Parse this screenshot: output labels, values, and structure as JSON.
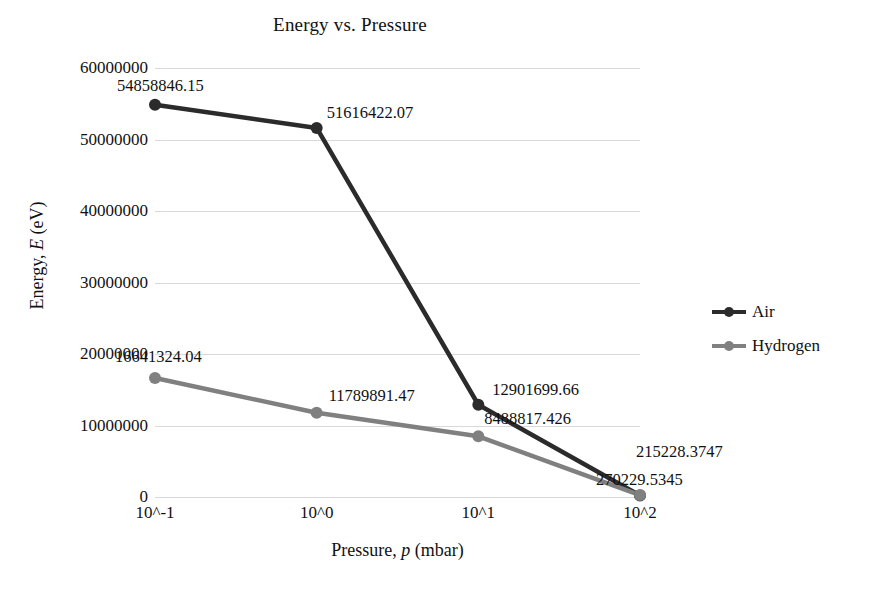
{
  "chart_data": {
    "type": "line",
    "title": "Energy vs. Pressure",
    "xlabel": "Pressure, p (mbar)",
    "ylabel": "Energy, E (eV)",
    "categories": [
      "10^-1",
      "10^0",
      "10^1",
      "10^2"
    ],
    "ylim": [
      0,
      60000000
    ],
    "ytick_labels": [
      "60000000",
      "50000000",
      "40000000",
      "30000000",
      "20000000",
      "10000000",
      "0"
    ],
    "ytick_values": [
      60000000,
      50000000,
      40000000,
      30000000,
      20000000,
      10000000,
      0
    ],
    "grid": true,
    "legend_position": "right",
    "series": [
      {
        "name": "Air",
        "color": "#2b2b2b",
        "values": [
          54858846.15,
          51616422.07,
          12901699.66,
          215228.3747
        ],
        "labels": [
          "54858846.15",
          "51616422.07",
          "12901699.66",
          "215228.3747"
        ]
      },
      {
        "name": "Hydrogen",
        "color": "#808080",
        "values": [
          16641324.04,
          11789891.47,
          8488817.426,
          270229.5345
        ],
        "labels": [
          "16641324.04",
          "11789891.47",
          "8488817.426",
          "270229.5345"
        ]
      }
    ]
  },
  "axis": {
    "y_title_prefix": "Energy, ",
    "y_title_italic": "E",
    "y_title_suffix": " (eV)",
    "x_title_prefix": "Pressure, ",
    "x_title_italic": "p",
    "x_title_suffix": " (mbar)"
  },
  "colors": {
    "gridline": "#d9d9d9",
    "air": "#2b2b2b",
    "hydrogen": "#808080",
    "text": "#111111",
    "background": "#ffffff"
  }
}
